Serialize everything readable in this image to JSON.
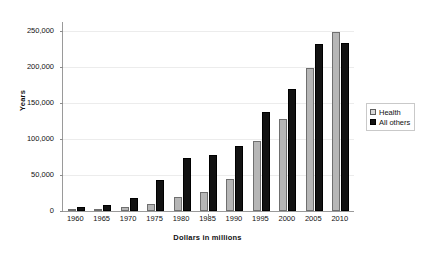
{
  "chart_data": {
    "type": "bar",
    "title": "",
    "subtitle": "",
    "xlabel": "Dollars in millions",
    "ylabel": "Years",
    "categories": [
      "1960",
      "1965",
      "1970",
      "1975",
      "1980",
      "1985",
      "1990",
      "1995",
      "2000",
      "2005",
      "2010"
    ],
    "series": [
      {
        "name": "Health",
        "color": "#b6b6b6",
        "values": [
          2000,
          3000,
          6000,
          10000,
          20000,
          27000,
          44000,
          97000,
          127000,
          198000,
          248000
        ]
      },
      {
        "name": "All others",
        "color": "#121212",
        "values": [
          5000,
          9000,
          18000,
          43000,
          73000,
          78000,
          90000,
          137000,
          169000,
          231000,
          233000
        ]
      }
    ],
    "ylim": [
      0,
      262000
    ],
    "y_ticks": [
      0,
      50000,
      100000,
      150000,
      200000,
      250000
    ],
    "y_tick_labels": [
      "0",
      "50,000",
      "100,000",
      "150,000",
      "200,000",
      "250,000"
    ],
    "grid": true,
    "grid_axis": "y",
    "legend_position": "right",
    "legend_entries": [
      "Health",
      "All others"
    ],
    "background_color": "#ffffff",
    "axis_color": "#9a9a9a",
    "gridline_color": "#ececec"
  }
}
